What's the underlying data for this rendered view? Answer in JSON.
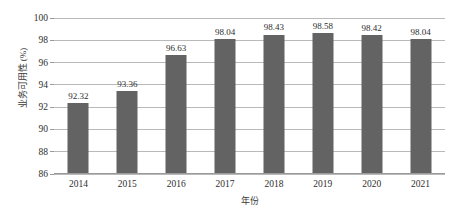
{
  "chart_data": {
    "type": "bar",
    "title": "",
    "subtitle": "",
    "xlabel": "年份",
    "ylabel": "业务可用性 (%)",
    "categories": [
      "2014",
      "2015",
      "2016",
      "2017",
      "2018",
      "2019",
      "2020",
      "2021"
    ],
    "values": [
      92.32,
      93.36,
      96.63,
      98.04,
      98.43,
      98.58,
      98.42,
      98.04
    ],
    "data_labels": [
      "92.32",
      "93.36",
      "96.63",
      "98.04",
      "98.43",
      "98.58",
      "98.42",
      "98.04"
    ],
    "ylim": [
      86,
      100
    ],
    "yticks": [
      86,
      88,
      90,
      92,
      94,
      96,
      98,
      100
    ],
    "ytick_labels": [
      "86",
      "88",
      "90",
      "92",
      "94",
      "96",
      "98",
      "100"
    ],
    "grid": true,
    "grid_axis": "y",
    "legend": null,
    "legend_position": "none",
    "series": [
      {
        "name": "业务可用性",
        "values": [
          92.32,
          93.36,
          96.63,
          98.04,
          98.43,
          98.58,
          98.42,
          98.04
        ]
      }
    ],
    "colors": {
      "bar": "#636363",
      "gridline": "#b9b9b9",
      "axis": "#9a9a9a",
      "text": "#2e2e2e",
      "background": "#ffffff"
    }
  }
}
